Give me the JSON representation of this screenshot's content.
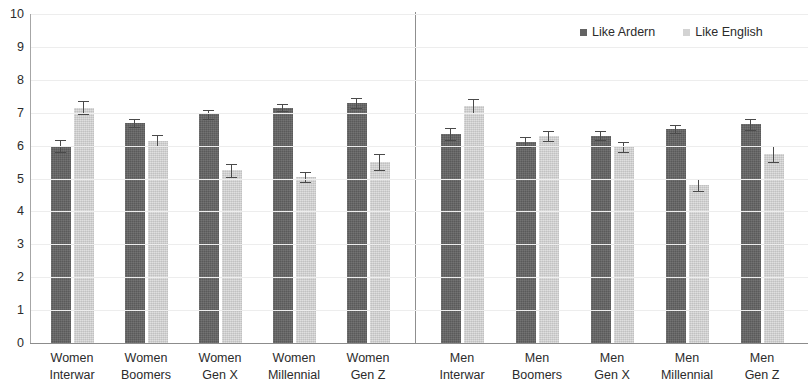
{
  "chart_data": {
    "type": "bar",
    "title": "",
    "subtitle": "",
    "xlabel": "",
    "ylabel": "",
    "ylim": [
      0,
      10
    ],
    "y_ticks": [
      10,
      9,
      8,
      7,
      6,
      5,
      4,
      3,
      2,
      1,
      0
    ],
    "grid": true,
    "legend_position": "top-right",
    "panel_divider_after_category_index": 4,
    "categories": [
      "Women Interwar",
      "Women Boomers",
      "Women Gen X",
      "Women Millennial",
      "Women Gen Z",
      "Men Interwar",
      "Men Boomers",
      "Men Gen X",
      "Men Millennial",
      "Men Gen Z"
    ],
    "category_lines": [
      [
        "Women",
        "Interwar"
      ],
      [
        "Women",
        "Boomers"
      ],
      [
        "Women",
        "Gen X"
      ],
      [
        "Women",
        "Millennial"
      ],
      [
        "Women",
        "Gen Z"
      ],
      [
        "Men",
        "Interwar"
      ],
      [
        "Men",
        "Boomers"
      ],
      [
        "Men",
        "Gen X"
      ],
      [
        "Men",
        "Millennial"
      ],
      [
        "Men",
        "Gen Z"
      ]
    ],
    "series": [
      {
        "name": "Like Ardern",
        "color": "#636363",
        "values": [
          6.0,
          6.7,
          6.95,
          7.15,
          7.3,
          6.35,
          6.1,
          6.3,
          6.5,
          6.65
        ],
        "errors": [
          0.18,
          0.12,
          0.14,
          0.1,
          0.15,
          0.17,
          0.15,
          0.13,
          0.12,
          0.17
        ]
      },
      {
        "name": "Like English",
        "color": "#d3d3d3",
        "values": [
          7.15,
          6.15,
          5.25,
          5.05,
          5.5,
          7.2,
          6.3,
          5.95,
          4.8,
          5.75
        ],
        "errors": [
          0.2,
          0.17,
          0.2,
          0.15,
          0.25,
          0.22,
          0.15,
          0.15,
          0.18,
          0.25
        ]
      }
    ]
  },
  "legend": {
    "items": [
      {
        "label": "Like Ardern",
        "swatch": "dark-square-marker"
      },
      {
        "label": "Like English",
        "swatch": "light-square-marker"
      }
    ]
  },
  "colors": {
    "series_dark": "#636363",
    "series_light": "#d3d3d3",
    "gridline": "#ededed",
    "axis": "#8c8c8c",
    "text": "#2b2b2b",
    "background": "#ffffff"
  }
}
